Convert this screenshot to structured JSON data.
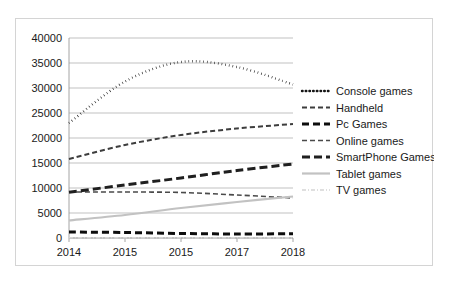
{
  "chart_data": {
    "type": "line",
    "title": "",
    "subtitle": "",
    "xlabel": "",
    "ylabel": "",
    "x": [
      "2014",
      "2015",
      "2015",
      "2017",
      "2018"
    ],
    "categories": [
      "2014",
      "2015",
      "2015",
      "2017",
      "2018"
    ],
    "xlim": [
      2014,
      2018
    ],
    "ylim": [
      0,
      40000
    ],
    "ytick_labels": [
      "0",
      "5000",
      "10000",
      "15000",
      "20000",
      "25000",
      "30000",
      "35000",
      "40000"
    ],
    "ytick_values": [
      0,
      5000,
      10000,
      15000,
      20000,
      25000,
      30000,
      35000,
      40000
    ],
    "xtick_labels": [
      "2014",
      "2015",
      "2015",
      "2017",
      "2018"
    ],
    "grid": "horizontal",
    "legend_position": "right",
    "series": [
      {
        "name": "Console games",
        "values": [
          23000,
          31300,
          35200,
          34200,
          30700
        ],
        "color": "#141414",
        "style": "dotted",
        "width": 2.4,
        "dasharray": "0.6 3.1"
      },
      {
        "name": "Handheld",
        "values": [
          15800,
          18600,
          20600,
          21900,
          22800
        ],
        "color": "#3d3d3d",
        "style": "dashed",
        "width": 2.0,
        "dasharray": "5 3"
      },
      {
        "name": "Pc Games",
        "values": [
          1200,
          1100,
          900,
          800,
          850
        ],
        "color": "#0d0d0d",
        "style": "dashed-bold",
        "width": 3.0,
        "dasharray": "7 4"
      },
      {
        "name": "Online games",
        "values": [
          9200,
          9200,
          9100,
          8600,
          8000
        ],
        "color": "#4a4a4a",
        "style": "dashed-thin",
        "width": 1.6,
        "dasharray": "5 3"
      },
      {
        "name": "SmartPhone Games",
        "values": [
          9150,
          10600,
          12000,
          13500,
          14800
        ],
        "color": "#1f1f1f",
        "style": "dashed-bold",
        "width": 3.0,
        "dasharray": "8 4"
      },
      {
        "name": "Tablet games",
        "values": [
          3500,
          4600,
          6000,
          7200,
          8300
        ],
        "color": "#c2c2c2",
        "style": "solid",
        "width": 2.2,
        "dasharray": ""
      },
      {
        "name": "TV games",
        "values": [
          60,
          50,
          40,
          40,
          30
        ],
        "color": "#d5d5d5",
        "style": "dash-dot",
        "width": 1.6,
        "dasharray": "4 2 1 2"
      }
    ]
  },
  "legend": {
    "items": [
      {
        "label": "Console games"
      },
      {
        "label": "Handheld"
      },
      {
        "label": "Pc Games"
      },
      {
        "label": "Online games"
      },
      {
        "label": "SmartPhone Games"
      },
      {
        "label": "Tablet games"
      },
      {
        "label": "TV games"
      }
    ]
  },
  "colors": {
    "background": "#ffffff",
    "frame_border": "#d4d4d4",
    "gridline": "#a6a6a6",
    "axis": "#9a9a9a",
    "text": "#1a1a1a"
  }
}
